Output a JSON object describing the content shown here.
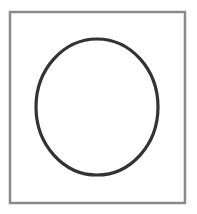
{
  "figure": {
    "frame": {
      "x": 10,
      "y": 12,
      "width": 175,
      "height": 191,
      "stroke": "#8a8a8a",
      "stroke_width": 2.5,
      "fill": "#ffffff"
    },
    "ellipse": {
      "cx": 97,
      "cy": 107,
      "rx": 61,
      "ry": 68,
      "stroke": "#333333",
      "stroke_width": 3.2,
      "fill": "none"
    }
  }
}
